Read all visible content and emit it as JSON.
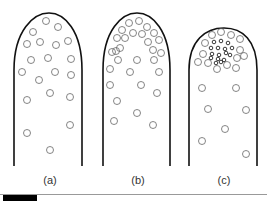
{
  "panels": [
    {
      "id": "a",
      "label": "(a)",
      "label_x": 35,
      "outline": "M14,166 L14,70 C14,30 34,13 49,13 C64,13 82,30 82,70 L82,166",
      "circles": [
        [
          46,
          21
        ],
        [
          58,
          27
        ],
        [
          33,
          32
        ],
        [
          27,
          44
        ],
        [
          40,
          42
        ],
        [
          56,
          45
        ],
        [
          68,
          41
        ],
        [
          31,
          60
        ],
        [
          48,
          58
        ],
        [
          71,
          59
        ],
        [
          22,
          72
        ],
        [
          55,
          72
        ],
        [
          71,
          75
        ],
        [
          39,
          80
        ],
        [
          50,
          93
        ],
        [
          70,
          97
        ],
        [
          27,
          100
        ],
        [
          70,
          125
        ],
        [
          27,
          133
        ],
        [
          50,
          150
        ]
      ]
    },
    {
      "id": "b",
      "label": "(b)",
      "label_x": 123,
      "outline": "M103,166 L103,70 C103,30 122,13 137,13 C152,13 170,30 170,70 L170,166",
      "circles": [
        [
          129,
          23
        ],
        [
          139,
          21
        ],
        [
          147,
          27
        ],
        [
          122,
          30
        ],
        [
          133,
          33
        ],
        [
          142,
          34
        ],
        [
          154,
          33
        ],
        [
          117,
          38
        ],
        [
          125,
          38
        ],
        [
          159,
          40
        ],
        [
          116,
          51
        ],
        [
          120,
          48
        ],
        [
          148,
          42
        ],
        [
          153,
          50
        ],
        [
          161,
          53
        ],
        [
          112,
          52
        ],
        [
          118,
          60
        ],
        [
          137,
          60
        ],
        [
          154,
          60
        ],
        [
          110,
          69
        ],
        [
          130,
          72
        ],
        [
          159,
          72
        ],
        [
          110,
          85
        ],
        [
          141,
          85
        ],
        [
          157,
          93
        ],
        [
          117,
          101
        ],
        [
          137,
          113
        ],
        [
          114,
          121
        ],
        [
          153,
          125
        ]
      ]
    },
    {
      "id": "c",
      "label": "(c)",
      "label_x": 209,
      "outline": "M189,166 L189,70 C189,40 206,28 224,28 C242,28 257,40 257,70 L257,166",
      "circles": [
        [
          212,
          35
        ],
        [
          221,
          32
        ],
        [
          231,
          35
        ],
        [
          240,
          39
        ],
        [
          205,
          43
        ],
        [
          240,
          50
        ],
        [
          203,
          54
        ],
        [
          237,
          58
        ],
        [
          244,
          56
        ],
        [
          198,
          62
        ],
        [
          208,
          63
        ],
        [
          217,
          69
        ],
        [
          227,
          65
        ],
        [
          236,
          68
        ],
        [
          236,
          88
        ],
        [
          202,
          88
        ],
        [
          208,
          109
        ],
        [
          246,
          110
        ],
        [
          225,
          129
        ],
        [
          202,
          141
        ],
        [
          246,
          154
        ]
      ],
      "small_circles": [
        [
          214,
          42
        ],
        [
          221,
          41
        ],
        [
          228,
          43
        ],
        [
          211,
          48
        ],
        [
          218,
          48
        ],
        [
          225,
          49
        ],
        [
          232,
          48
        ],
        [
          212,
          54
        ],
        [
          219,
          55
        ],
        [
          226,
          53
        ],
        [
          230,
          55
        ],
        [
          211,
          58
        ],
        [
          218,
          59
        ],
        [
          224,
          60
        ],
        [
          221,
          62
        ],
        [
          216,
          63
        ]
      ]
    }
  ],
  "scale_bar": {
    "x": 3,
    "width": 34
  }
}
